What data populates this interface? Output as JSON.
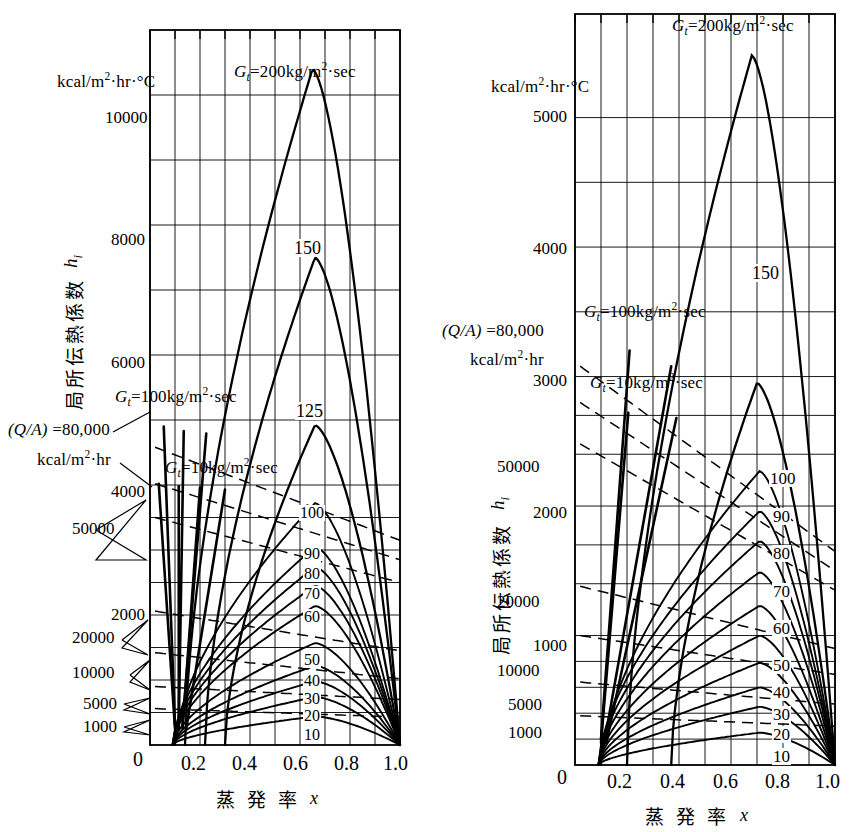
{
  "figure": {
    "kind": "two-panel-line-chart",
    "background": "#ffffff",
    "ink": "#000000"
  },
  "common": {
    "x_axis_title": "蒸 発 率",
    "x_axis_symbol": "x",
    "y_axis_title": "局所伝熱係数",
    "y_axis_symbol": "h",
    "y_axis_symbol_sub": "i",
    "unit_h": "kcal/m²·hr·°C",
    "unit_qa_value": "(Q/A) =80,000",
    "unit_qa_units": "kcal/m²·hr",
    "g200": "G",
    "g200_sub": "t",
    "g200_rest": "=200kg/m²·sec",
    "g100_rest": "=100kg/m²·sec",
    "g10_rest": "=10kg/m²·sec",
    "x_ticks": [
      "0",
      "0.2",
      "0.4",
      "0.6",
      "0.8",
      "1.0"
    ],
    "x_tick_values": [
      0,
      0.2,
      0.4,
      0.6,
      0.8,
      1.0
    ],
    "x_gridlines": [
      0,
      0.1,
      0.2,
      0.3,
      0.4,
      0.5,
      0.6,
      0.7,
      0.8,
      0.9,
      1.0
    ]
  },
  "chart_data": [
    {
      "id": "left-panel",
      "type": "line",
      "title": "",
      "xlabel": "蒸 発 率 x",
      "ylabel": "局所伝熱係数 h_i",
      "xlim": [
        0,
        1.0
      ],
      "ylim": [
        0,
        11000
      ],
      "grid": true,
      "legend_position": "inline-annotations",
      "y_ticks_left_primary": [
        "10000",
        "8000",
        "6000",
        "4000",
        "2000",
        "0"
      ],
      "y_tick_values_primary": [
        10000,
        8000,
        6000,
        4000,
        2000,
        0
      ],
      "y_callouts": [
        "50000",
        "20000",
        "10000",
        "5000",
        "1000"
      ],
      "y_callout_values": [
        50000,
        20000,
        10000,
        5000,
        1000
      ],
      "annotations": [
        {
          "text": "G_t=200kg/m²·sec",
          "x": 0.38,
          "y": 10700
        },
        {
          "text": "150",
          "x": 0.6,
          "y": 7900
        },
        {
          "text": "125",
          "x": 0.64,
          "y": 4950
        },
        {
          "text": "G_t=100kg/m²·sec",
          "x": 0.05,
          "y": 5400
        },
        {
          "text": "G_t=10kg/m²·sec",
          "x": 0.08,
          "y": 4350
        },
        {
          "text": "(Q/A) =80,000 kcal/m²·hr",
          "x": -0.55,
          "y": 4850
        }
      ],
      "series": [
        {
          "name": "200",
          "peak_x": 0.65,
          "peak_y": 10400,
          "start_x": 0.14,
          "end_x": 1.0
        },
        {
          "name": "150",
          "peak_x": 0.66,
          "peak_y": 7500,
          "start_x": 0.22,
          "end_x": 1.0
        },
        {
          "name": "125",
          "peak_x": 0.66,
          "peak_y": 4920,
          "start_x": 0.3,
          "end_x": 1.0
        },
        {
          "name": "100",
          "peak_x": 0.66,
          "peak_y": 3720,
          "start_x": 0.1,
          "end_x": 1.0
        },
        {
          "name": "90",
          "peak_x": 0.66,
          "peak_y": 3050,
          "start_x": 0.09,
          "end_x": 1.0
        },
        {
          "name": "80",
          "peak_x": 0.66,
          "peak_y": 2740,
          "start_x": 0.09,
          "end_x": 1.0
        },
        {
          "name": "70",
          "peak_x": 0.66,
          "peak_y": 2450,
          "start_x": 0.09,
          "end_x": 1.0
        },
        {
          "name": "60",
          "peak_x": 0.66,
          "peak_y": 2140,
          "start_x": 0.09,
          "end_x": 1.0
        },
        {
          "name": "50",
          "peak_x": 0.66,
          "peak_y": 1570,
          "start_x": 0.09,
          "end_x": 1.0
        },
        {
          "name": "40",
          "peak_x": 0.66,
          "peak_y": 1220,
          "start_x": 0.09,
          "end_x": 1.0
        },
        {
          "name": "30",
          "peak_x": 0.66,
          "peak_y": 980,
          "start_x": 0.09,
          "end_x": 1.0
        },
        {
          "name": "20",
          "peak_x": 0.66,
          "peak_y": 740,
          "start_x": 0.09,
          "end_x": 1.0
        },
        {
          "name": "10",
          "peak_x": 0.66,
          "peak_y": 440,
          "start_x": 0.09,
          "end_x": 1.0
        }
      ],
      "curve_labels": [
        "150",
        "125",
        "100",
        "90",
        "80",
        "70",
        "60",
        "50",
        "40",
        "30",
        "20",
        "10"
      ]
    },
    {
      "id": "right-panel",
      "type": "line",
      "title": "",
      "xlabel": "蒸 発 率 x",
      "ylabel": "局所伝熱係数 h_i",
      "xlim": [
        0,
        1.0
      ],
      "ylim": [
        0,
        5800
      ],
      "grid": true,
      "legend_position": "inline-annotations",
      "y_ticks_left_primary": [
        "5000",
        "4000",
        "3000",
        "2000",
        "1000",
        "0"
      ],
      "y_tick_values_primary": [
        5000,
        4000,
        3000,
        2000,
        1000,
        0
      ],
      "y_callouts": [
        "50000",
        "20000",
        "10000",
        "5000",
        "1000"
      ],
      "y_callout_values": [
        50000,
        20000,
        10000,
        5000,
        1000
      ],
      "annotations": [
        {
          "text": "G_t=200kg/m²·sec",
          "x": 0.36,
          "y": 5650
        },
        {
          "text": "150",
          "x": 0.68,
          "y": 3080
        },
        {
          "text": "G_t=100kg/m²·sec",
          "x": 0.12,
          "y": 3380
        },
        {
          "text": "G_t=10kg/m²·sec",
          "x": 0.1,
          "y": 2880
        },
        {
          "text": "(Q/A) =80,000 kcal/m²·hr",
          "x": -0.55,
          "y": 3300
        }
      ],
      "series": [
        {
          "name": "200",
          "peak_x": 0.68,
          "peak_y": 5480,
          "start_x": 0.2,
          "end_x": 1.0
        },
        {
          "name": "150",
          "peak_x": 0.7,
          "peak_y": 2950,
          "start_x": 0.37,
          "end_x": 1.0
        },
        {
          "name": "100",
          "peak_x": 0.71,
          "peak_y": 2270,
          "start_x": 0.1,
          "end_x": 1.0
        },
        {
          "name": "90",
          "peak_x": 0.71,
          "peak_y": 1960,
          "start_x": 0.09,
          "end_x": 1.0
        },
        {
          "name": "80",
          "peak_x": 0.71,
          "peak_y": 1730,
          "start_x": 0.09,
          "end_x": 1.0
        },
        {
          "name": "70",
          "peak_x": 0.71,
          "peak_y": 1490,
          "start_x": 0.09,
          "end_x": 1.0
        },
        {
          "name": "60",
          "peak_x": 0.71,
          "peak_y": 1230,
          "start_x": 0.09,
          "end_x": 1.0
        },
        {
          "name": "50",
          "peak_x": 0.71,
          "peak_y": 1000,
          "start_x": 0.09,
          "end_x": 1.0
        },
        {
          "name": "40",
          "peak_x": 0.71,
          "peak_y": 790,
          "start_x": 0.09,
          "end_x": 1.0
        },
        {
          "name": "30",
          "peak_x": 0.71,
          "peak_y": 600,
          "start_x": 0.09,
          "end_x": 1.0
        },
        {
          "name": "20",
          "peak_x": 0.71,
          "peak_y": 450,
          "start_x": 0.09,
          "end_x": 1.0
        },
        {
          "name": "10",
          "peak_x": 0.71,
          "peak_y": 250,
          "start_x": 0.09,
          "end_x": 1.0
        }
      ],
      "curve_labels": [
        "150",
        "100",
        "90",
        "80",
        "70",
        "60",
        "50",
        "40",
        "30",
        "20",
        "10"
      ]
    }
  ]
}
